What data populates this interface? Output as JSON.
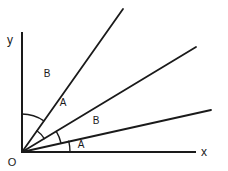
{
  "figure": {
    "background_color": "#ffffff",
    "stroke_color": "#1a1a1a",
    "width": 228,
    "height": 171
  },
  "axes": {
    "origin_label": "O",
    "x_label": "x",
    "y_label": "y",
    "origin": {
      "x": 22,
      "y": 152
    },
    "x_axis_end": {
      "x": 195,
      "y": 152
    },
    "y_axis_end": {
      "x": 22,
      "y": 33
    }
  },
  "rays": [
    {
      "name": "ray-steep",
      "end": {
        "x": 123,
        "y": 9
      },
      "angle_from_x_axis_deg": 55
    },
    {
      "name": "ray-middle",
      "end": {
        "x": 196,
        "y": 47
      },
      "angle_from_x_axis_deg": 31
    },
    {
      "name": "ray-shallow",
      "end": {
        "x": 211,
        "y": 110
      },
      "angle_from_x_axis_deg": 13
    }
  ],
  "angle_marks": [
    {
      "name": "angle-b-upper",
      "label": "B",
      "label_pos": {
        "x": 47,
        "y": 77
      },
      "radius": 38,
      "start_deg": 90,
      "end_deg": 55,
      "between": "y-axis and ray-steep"
    },
    {
      "name": "angle-a-upper",
      "label": "A",
      "label_pos": {
        "x": 63,
        "y": 106
      },
      "radius": 26,
      "start_deg": 55,
      "end_deg": 31,
      "between": "ray-steep and ray-middle"
    },
    {
      "name": "angle-b-lower",
      "label": "B",
      "label_pos": {
        "x": 96,
        "y": 124
      },
      "radius": 40,
      "start_deg": 31,
      "end_deg": 13,
      "between": "ray-middle and ray-shallow"
    },
    {
      "name": "angle-a-lower",
      "label": "A",
      "label_pos": {
        "x": 81,
        "y": 148
      },
      "radius": 48,
      "start_deg": 13,
      "end_deg": 0,
      "between": "ray-shallow and x-axis"
    }
  ]
}
